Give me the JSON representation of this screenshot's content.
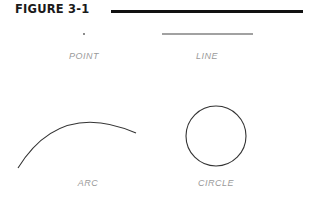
{
  "figure": {
    "title": "FIGURE 3-1"
  },
  "shapes": [
    {
      "id": "point",
      "label": "POINT"
    },
    {
      "id": "line",
      "label": "LINE"
    },
    {
      "id": "arc",
      "label": "ARC"
    },
    {
      "id": "circle",
      "label": "CIRCLE"
    }
  ],
  "colors": {
    "stroke": "#333333",
    "label": "#9a9a9a",
    "rule": "#111111"
  }
}
